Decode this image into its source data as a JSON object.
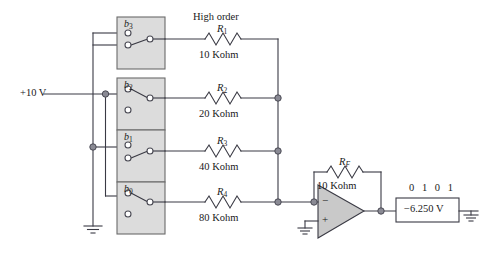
{
  "diagram": {
    "title_note": "High order",
    "source_label": "+10 V",
    "bits_label": "0 1 0 1",
    "output_value": "−6.250 V",
    "feedback": {
      "symbol_base": "R",
      "symbol_sub": "F",
      "value": "10 Kohm"
    },
    "opamp": {
      "minus": "−",
      "plus": "+"
    },
    "branches": [
      {
        "switch_base": "b",
        "switch_sub": "3",
        "resistor_base": "R",
        "resistor_sub": "1",
        "resistor_value": "10 Kohm",
        "state": "open",
        "note": "High order"
      },
      {
        "switch_base": "b",
        "switch_sub": "2",
        "resistor_base": "R",
        "resistor_sub": "2",
        "resistor_value": "20 Kohm",
        "state": "closed",
        "note": ""
      },
      {
        "switch_base": "b",
        "switch_sub": "1",
        "resistor_base": "R",
        "resistor_sub": "3",
        "resistor_value": "40 Kohm",
        "state": "open",
        "note": ""
      },
      {
        "switch_base": "b",
        "switch_sub": "0",
        "resistor_base": "R",
        "resistor_sub": "4",
        "resistor_value": "80 Kohm",
        "state": "closed",
        "note": ""
      }
    ],
    "colors": {
      "wire": "#3a3a44",
      "box_fill": "#dcdcdc",
      "box_stroke": "#6b6b6b",
      "opamp_fill": "#c9c9c9",
      "text": "#1a1a1a",
      "node": "#6b6b6b"
    }
  }
}
